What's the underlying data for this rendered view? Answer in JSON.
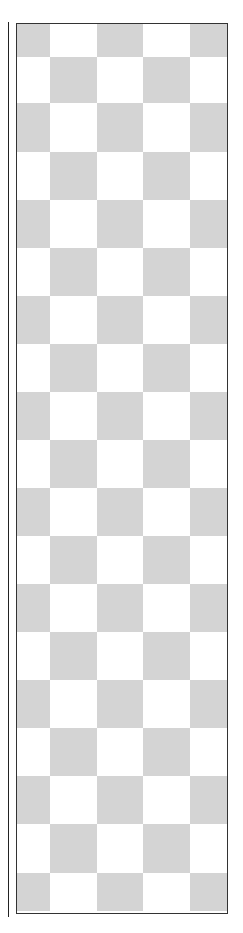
{
  "pattern": {
    "type": "checkerboard",
    "colors": {
      "dark": "#d4d4d4",
      "light": "#ffffff",
      "border": "#333333"
    },
    "column_widths": [
      33,
      47,
      46,
      47,
      37
    ],
    "row_heights": [
      33,
      46,
      49,
      48,
      48,
      48,
      48,
      48,
      48,
      48,
      48,
      48,
      48,
      48,
      48,
      48,
      48,
      49,
      38
    ],
    "first_cell_dark": true
  }
}
